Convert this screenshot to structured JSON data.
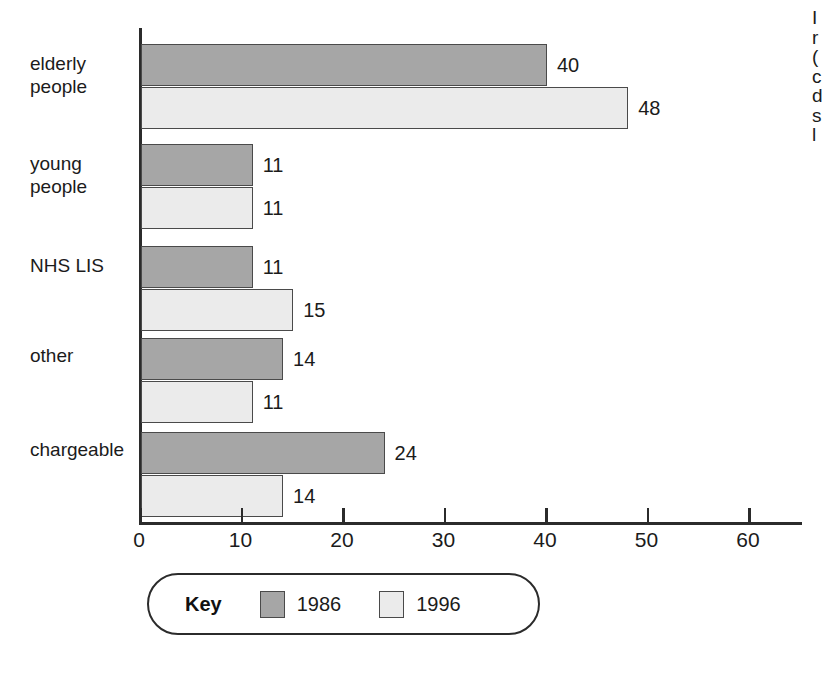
{
  "chart_data": {
    "type": "bar",
    "orientation": "horizontal",
    "title": "",
    "subtitle": "",
    "xlabel": "",
    "ylabel": "",
    "categories": [
      "elderly\npeople",
      "young\npeople",
      "NHS LIS",
      "other",
      "chargeable"
    ],
    "series": [
      {
        "name": "1986",
        "color": "#a6a6a6",
        "values": [
          40,
          11,
          11,
          14,
          24
        ]
      },
      {
        "name": "1996",
        "color": "#ebebeb",
        "values": [
          48,
          11,
          15,
          11,
          14
        ]
      }
    ],
    "xlim": [
      0,
      60
    ],
    "xticks": [
      0,
      10,
      20,
      30,
      40,
      50,
      60
    ],
    "xtick_labels": [
      "0",
      "10",
      "20",
      "30",
      "40",
      "50",
      "60"
    ],
    "grid": false,
    "data_labels": true,
    "legend": {
      "title": "Key",
      "position": "below-axis",
      "entries": [
        "1986",
        "1996"
      ]
    }
  },
  "legend": {
    "key_label": "Key",
    "entry_1986": "1986",
    "entry_1996": "1996"
  },
  "edge_text": "I\nr\n(\nc\nd\ns\nl",
  "colors": {
    "series_1986": "#a6a6a6",
    "series_1996": "#ebebeb",
    "bar_border": "#4a4a4a",
    "axis": "#2b2b2b",
    "text": "#1b1b1b",
    "background": "#ffffff"
  }
}
